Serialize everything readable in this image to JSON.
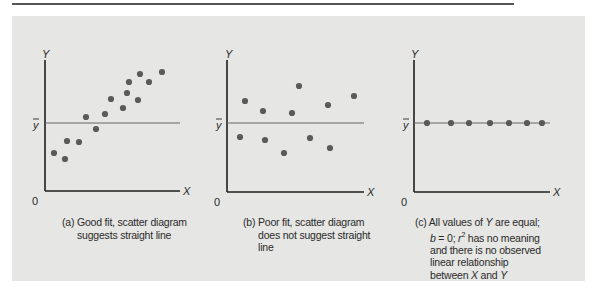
{
  "page": {
    "accent_line_color": "#555555",
    "panel_color": "#e6e6e4",
    "point_color": "#5a5a5a"
  },
  "labels": {
    "y": "Y",
    "x": "X",
    "origin": "0",
    "ybar": "y"
  },
  "chart_data": [
    {
      "type": "scatter",
      "title": "(a) Good fit, scatter diagram suggests straight line",
      "xlabel": "X",
      "ylabel": "Y",
      "reference_line": "ȳ (mean of Y)",
      "points_px": [
        [
          54,
          153
        ],
        [
          65,
          159
        ],
        [
          67,
          141
        ],
        [
          79,
          142
        ],
        [
          86,
          117
        ],
        [
          96,
          129
        ],
        [
          105,
          114
        ],
        [
          111,
          99
        ],
        [
          123,
          108
        ],
        [
          127,
          93
        ],
        [
          129,
          82
        ],
        [
          138,
          100
        ],
        [
          140,
          74
        ],
        [
          149,
          82
        ],
        [
          162,
          72
        ]
      ]
    },
    {
      "type": "scatter",
      "title": "(b) Poor fit, scatter diagram does not suggest straight line",
      "xlabel": "X",
      "ylabel": "Y",
      "reference_line": "ȳ (mean of Y)",
      "points_px": [
        [
          245,
          101
        ],
        [
          263,
          111
        ],
        [
          299,
          86
        ],
        [
          292,
          113
        ],
        [
          328,
          105
        ],
        [
          354,
          96
        ],
        [
          240,
          137
        ],
        [
          265,
          140
        ],
        [
          284,
          153
        ],
        [
          310,
          138
        ],
        [
          330,
          148
        ]
      ]
    },
    {
      "type": "scatter",
      "title": "(c) All values of Y are equal; b = 0; r² has no meaning and there is no observed linear relationship between X and Y",
      "xlabel": "X",
      "ylabel": "Y",
      "reference_line": "ȳ (mean of Y)",
      "points_px": [
        [
          427,
          123
        ],
        [
          451,
          123
        ],
        [
          469,
          123
        ],
        [
          490,
          123
        ],
        [
          509,
          123
        ],
        [
          527,
          123
        ],
        [
          542,
          123
        ]
      ]
    }
  ],
  "captions": {
    "a": {
      "l1": "(a) Good fit, scatter diagram",
      "l2": "suggests straight line"
    },
    "b": {
      "l1": "(b) Poor fit, scatter diagram",
      "l2": "does not suggest straight",
      "l3": "line"
    },
    "c": {
      "l1a": "(c) All values of ",
      "l1b": "Y",
      "l1c": " are equal;",
      "l2a": "b",
      "l2b": " = 0; ",
      "l2c": "r",
      "l2d": "2",
      "l2e": " has no meaning",
      "l3": "and there is no observed",
      "l4": "linear relationship",
      "l5a": "between ",
      "l5b": "X",
      "l5c": " and ",
      "l5d": "Y"
    }
  }
}
